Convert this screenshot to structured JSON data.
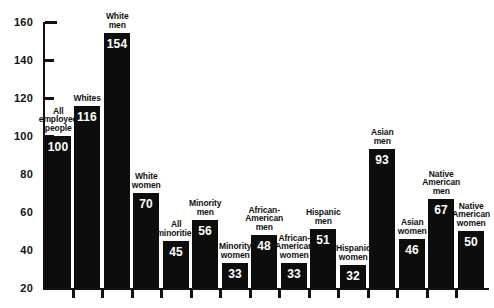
{
  "chart_data": {
    "type": "bar",
    "title": "",
    "subtitle": "",
    "xlabel": "",
    "ylabel": "",
    "ylim": [
      20,
      160
    ],
    "ytick_step": 20,
    "yticks": [
      20,
      40,
      60,
      80,
      100,
      120,
      140,
      160
    ],
    "grid": false,
    "legend": "none",
    "bar_color": "#0d0d0d",
    "background_color": "#ffffff",
    "categories": [
      "All employed people",
      "Whites",
      "White men",
      "White women",
      "All minorities",
      "Minority men",
      "Minority women",
      "African-American men",
      "African-American women",
      "Hispanic men",
      "Hispanic women",
      "Asian men",
      "Asian women",
      "Native American men",
      "Native American women"
    ],
    "values": [
      100,
      116,
      154,
      70,
      45,
      56,
      33,
      48,
      33,
      51,
      32,
      93,
      46,
      67,
      50
    ],
    "bars": [
      {
        "label": "All employed people",
        "label_lines": [
          "All",
          "employed",
          "people"
        ],
        "value": 100,
        "value_text": "100"
      },
      {
        "label": "Whites",
        "label_lines": [
          "Whites"
        ],
        "value": 116,
        "value_text": "116"
      },
      {
        "label": "White men",
        "label_lines": [
          "White",
          "men"
        ],
        "value": 154,
        "value_text": "154"
      },
      {
        "label": "White women",
        "label_lines": [
          "White",
          "women"
        ],
        "value": 70,
        "value_text": "70"
      },
      {
        "label": "All minorities",
        "label_lines": [
          "All",
          "minorities"
        ],
        "value": 45,
        "value_text": "45"
      },
      {
        "label": "Minority men",
        "label_lines": [
          "Minority",
          "men"
        ],
        "value": 56,
        "value_text": "56"
      },
      {
        "label": "Minority women",
        "label_lines": [
          "Minority",
          "women"
        ],
        "value": 33,
        "value_text": "33"
      },
      {
        "label": "African-American men",
        "label_lines": [
          "African-",
          "American",
          "men"
        ],
        "value": 48,
        "value_text": "48"
      },
      {
        "label": "African-American women",
        "label_lines": [
          "African-",
          "American",
          "women"
        ],
        "value": 33,
        "value_text": "33"
      },
      {
        "label": "Hispanic men",
        "label_lines": [
          "Hispanic",
          "men"
        ],
        "value": 51,
        "value_text": "51"
      },
      {
        "label": "Hispanic women",
        "label_lines": [
          "Hispanic",
          "women"
        ],
        "value": 32,
        "value_text": "32"
      },
      {
        "label": "Asian men",
        "label_lines": [
          "Asian",
          "men"
        ],
        "value": 93,
        "value_text": "93"
      },
      {
        "label": "Asian women",
        "label_lines": [
          "Asian",
          "women"
        ],
        "value": 46,
        "value_text": "46"
      },
      {
        "label": "Native American men",
        "label_lines": [
          "Native",
          "American",
          "men"
        ],
        "value": 67,
        "value_text": "67"
      },
      {
        "label": "Native American women",
        "label_lines": [
          "Native",
          "American",
          "women"
        ],
        "value": 50,
        "value_text": "50"
      }
    ]
  }
}
